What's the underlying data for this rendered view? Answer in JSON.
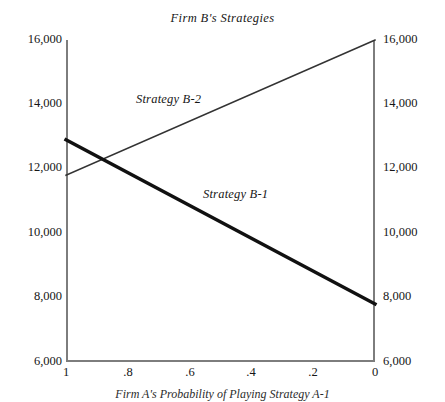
{
  "chart_data": {
    "type": "line",
    "title": "Firm B's Strategies",
    "xlabel": "Firm A's Probability of Playing Strategy A-1",
    "ylabel": "",
    "xlim": [
      1,
      0
    ],
    "ylim": [
      6000,
      16000
    ],
    "grid": false,
    "legend_position": "inline-annotations",
    "x_ticks": [
      "1",
      ".8",
      ".6",
      ".4",
      ".2",
      "0"
    ],
    "x_tick_values": [
      1,
      0.8,
      0.6,
      0.4,
      0.2,
      0
    ],
    "y_ticks": [
      "6,000",
      "8,000",
      "10,000",
      "12,000",
      "14,000",
      "16,000"
    ],
    "y_tick_values": [
      6000,
      8000,
      10000,
      12000,
      14000,
      16000
    ],
    "y_axis_right_duplicated": true,
    "series": [
      {
        "name": "Strategy B-1",
        "label": "Strategy B-1",
        "x": [
          1,
          0
        ],
        "values": [
          12900,
          7800
        ],
        "line_width": "thick",
        "color": "#111111"
      },
      {
        "name": "Strategy B-2",
        "label": "Strategy B-2",
        "x": [
          1,
          0
        ],
        "values": [
          11800,
          16000
        ],
        "line_width": "thin",
        "color": "#333333"
      }
    ],
    "intersection": {
      "x": 0.87,
      "y": 12650
    },
    "annotations": [
      {
        "text": "Strategy B-2",
        "x": 0.77,
        "y": 14050
      },
      {
        "text": "Strategy B-1",
        "x": 0.54,
        "y": 11200
      }
    ]
  },
  "title": {
    "text": "Firm B's Strategies"
  },
  "caption": {
    "text": "Firm A's Probability of Playing Strategy A-1"
  },
  "axes": {
    "y_left": [
      {
        "label": "16,000",
        "value": 16000
      },
      {
        "label": "14,000",
        "value": 14000
      },
      {
        "label": "12,000",
        "value": 12000
      },
      {
        "label": "10,000",
        "value": 10000
      },
      {
        "label": "8,000",
        "value": 8000
      },
      {
        "label": "6,000",
        "value": 6000
      }
    ],
    "y_right": [
      {
        "label": "16,000",
        "value": 16000
      },
      {
        "label": "14,000",
        "value": 14000
      },
      {
        "label": "12,000",
        "value": 12000
      },
      {
        "label": "10,000",
        "value": 10000
      },
      {
        "label": "8,000",
        "value": 8000
      },
      {
        "label": "6,000",
        "value": 6000
      }
    ],
    "x": [
      {
        "label": "1",
        "value": 1
      },
      {
        "label": ".8",
        "value": 0.8
      },
      {
        "label": ".6",
        "value": 0.6
      },
      {
        "label": ".4",
        "value": 0.4
      },
      {
        "label": ".2",
        "value": 0.2
      },
      {
        "label": "0",
        "value": 0
      }
    ]
  },
  "series_labels": {
    "b1": "Strategy B-1",
    "b2": "Strategy B-2"
  },
  "colors": {
    "line_b1": "#111111",
    "line_b2": "#333333",
    "axis": "#7d7d7d",
    "text": "#161616",
    "background": "#ffffff"
  }
}
